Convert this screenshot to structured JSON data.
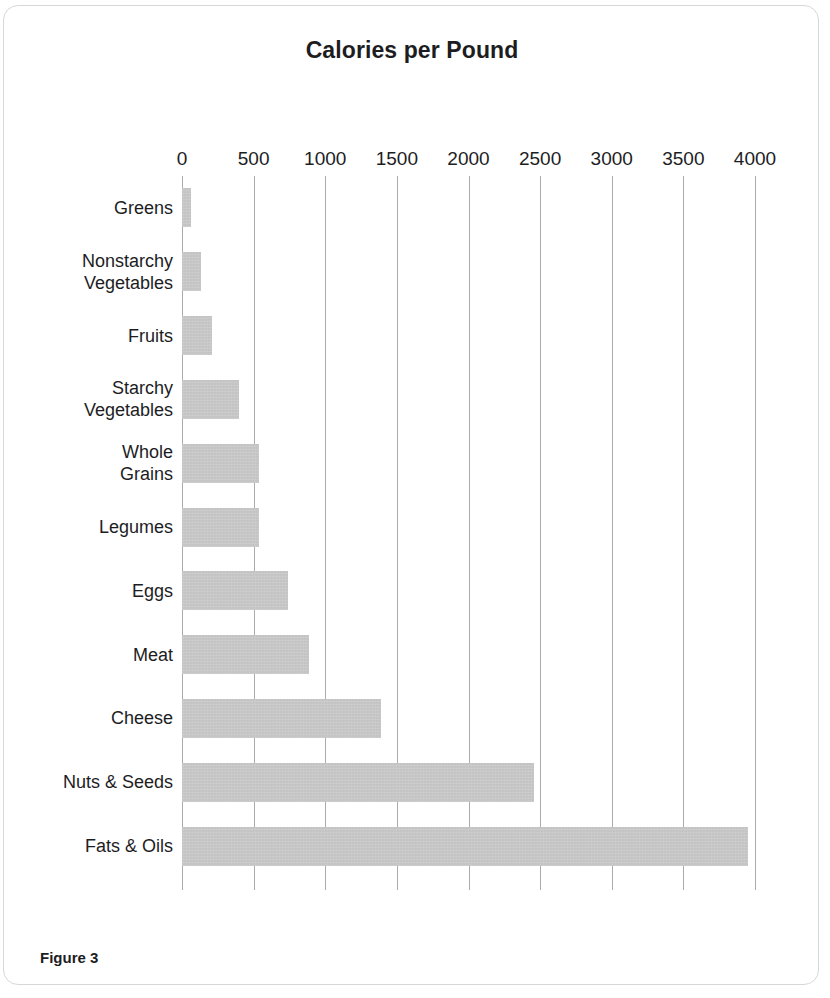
{
  "figure": {
    "caption": "Figure 3"
  },
  "chart_data": {
    "type": "bar",
    "orientation": "horizontal",
    "title": "Calories per Pound",
    "xlabel": "",
    "ylabel": "",
    "xlim": [
      0,
      4000
    ],
    "xticks": [
      0,
      500,
      1000,
      1500,
      2000,
      2500,
      3000,
      3500,
      4000
    ],
    "xtick_labels": [
      "0",
      "500",
      "1000",
      "1500",
      "2000",
      "2500",
      "3000",
      "3500",
      "4000"
    ],
    "grid": "vertical",
    "legend": "none",
    "bar_color": "#c9c9c9",
    "categories": [
      "Greens",
      "Nonstarchy Vegetables",
      "Fruits",
      "Starchy Vegetables",
      "Whole Grains",
      "Legumes",
      "Eggs",
      "Meat",
      "Cheese",
      "Nuts & Seeds",
      "Fats & Oils"
    ],
    "category_label_lines": [
      [
        "Greens"
      ],
      [
        "Nonstarchy",
        "Vegetables"
      ],
      [
        "Fruits"
      ],
      [
        "Starchy",
        "Vegetables"
      ],
      [
        "Whole",
        "Grains"
      ],
      [
        "Legumes"
      ],
      [
        "Eggs"
      ],
      [
        "Meat"
      ],
      [
        "Cheese"
      ],
      [
        "Nuts & Seeds"
      ],
      [
        "Fats & Oils"
      ]
    ],
    "values": [
      65,
      130,
      210,
      400,
      540,
      540,
      740,
      890,
      1390,
      2460,
      3950
    ]
  }
}
